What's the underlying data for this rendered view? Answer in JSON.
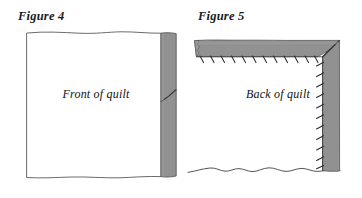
{
  "page": {
    "background_color": "#ffffff",
    "width": 362,
    "height": 198
  },
  "palette": {
    "binding_gray": "#919191",
    "binding_gray_dark": "#7d7d7d",
    "ink": "#1a1a1a",
    "outline": "#555555",
    "stitch": "#333333"
  },
  "figures": [
    {
      "id": "figure-4",
      "caption": "Figure 4",
      "label": "Front of quilt",
      "description": "quilt front panel with a gray binding strip along the right edge crossed by a diagonal seam line"
    },
    {
      "id": "figure-5",
      "caption": "Figure 5",
      "label": "Back of quilt",
      "description": "quilt back panel with gray binding folded over the top and right edges, hand stitches along the inner binding edges and a mitered corner"
    }
  ],
  "figure4": {
    "caption": "Figure 4",
    "label": "Front of quilt"
  },
  "figure5": {
    "caption": "Figure 5",
    "label": "Back of quilt"
  }
}
